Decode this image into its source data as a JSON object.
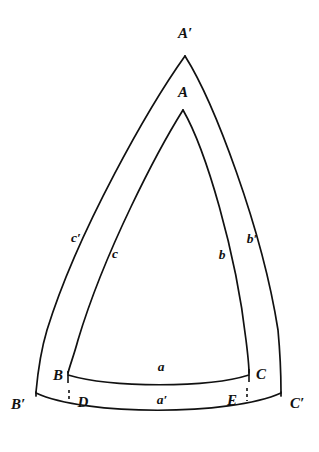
{
  "figure": {
    "background_color": "#ffffff",
    "stroke_color": "#111111",
    "vertices": [
      {
        "key": "A_prime",
        "label": "A′",
        "x": 185,
        "y": 38,
        "anchor": "middle"
      },
      {
        "key": "A",
        "label": "A",
        "x": 183,
        "y": 97,
        "anchor": "middle"
      },
      {
        "key": "B",
        "label": "B",
        "x": 58,
        "y": 380,
        "anchor": "middle"
      },
      {
        "key": "C",
        "label": "C",
        "x": 261,
        "y": 379,
        "anchor": "middle"
      },
      {
        "key": "B_prime",
        "label": "B′",
        "x": 18,
        "y": 409,
        "anchor": "middle"
      },
      {
        "key": "C_prime",
        "label": "C′",
        "x": 297,
        "y": 408,
        "anchor": "middle"
      },
      {
        "key": "D",
        "label": "D",
        "x": 83,
        "y": 407,
        "anchor": "middle"
      },
      {
        "key": "E",
        "label": "E",
        "x": 232,
        "y": 405,
        "anchor": "middle"
      }
    ],
    "sides": [
      {
        "key": "a",
        "label": "a",
        "x": 161,
        "y": 371,
        "anchor": "middle"
      },
      {
        "key": "a_prime",
        "label": "a′",
        "x": 162,
        "y": 404,
        "anchor": "middle"
      },
      {
        "key": "b",
        "label": "b",
        "x": 222,
        "y": 259,
        "anchor": "middle"
      },
      {
        "key": "b_prime",
        "label": "b′",
        "x": 252,
        "y": 243,
        "anchor": "middle"
      },
      {
        "key": "c",
        "label": "c",
        "x": 115,
        "y": 258,
        "anchor": "middle"
      },
      {
        "key": "c_prime",
        "label": "c′",
        "x": 76,
        "y": 242,
        "anchor": "middle"
      }
    ],
    "paths": {
      "outer_left": "M 185 56 C 150 105, 78 230, 47 330 C 41 350, 38 370, 36 392",
      "outer_right": "M 185 56 C 214 102, 262 228, 278 330 C 280 352, 281 374, 281 392",
      "outer_bottom": "M 36 393 C 85 416, 230 416, 281 393",
      "inner_left": "M 183 110 C 158 150, 105 250, 78 340 C 74 355, 70 365, 68 373",
      "inner_right": "M 183 110 C 206 150, 236 252, 246 340 C 248 356, 249 368, 249 373",
      "inner_bottom": "M 68 375 C 112 388, 208 388, 249 375",
      "left_edge_cap": "M 36 392 L 36 396",
      "right_edge_cap": "M 281 392 L 281 396"
    },
    "ticks": [
      {
        "key": "tick-B",
        "x1": 68,
        "y1": 371,
        "x2": 68,
        "y2": 383,
        "style": "solid"
      },
      {
        "key": "tick-C",
        "x1": 249,
        "y1": 369,
        "x2": 249,
        "y2": 382,
        "style": "solid"
      },
      {
        "key": "tick-D",
        "x1": 69,
        "y1": 390,
        "x2": 69,
        "y2": 402,
        "style": "dashed"
      },
      {
        "key": "tick-E",
        "x1": 247,
        "y1": 388,
        "x2": 247,
        "y2": 401,
        "style": "dashed"
      }
    ]
  }
}
